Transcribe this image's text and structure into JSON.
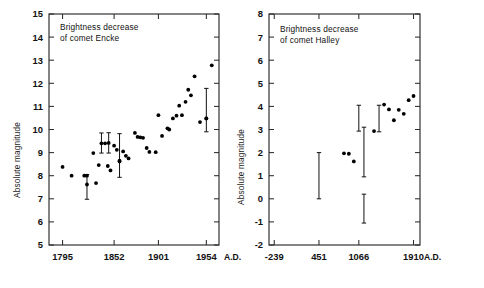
{
  "figure": {
    "background": "#ffffff",
    "ink": "#111111"
  },
  "panels": [
    {
      "id": "encke",
      "title_line1": "Brightness decrease",
      "title_line2": "of comet Encke",
      "ylabel": "Absolute magnitude",
      "xaxis_suffix": "A.D.",
      "chart_data": {
        "type": "scatter",
        "title": "Brightness decrease of comet Encke",
        "xlabel": "A.D.",
        "ylabel": "Absolute magnitude",
        "ylim": [
          5,
          15
        ],
        "xlim": [
          1780,
          1968
        ],
        "grid": false,
        "legend": null,
        "ytick_labels": [
          "5",
          "6",
          "7",
          "8",
          "9",
          "10",
          "11",
          "12",
          "13",
          "14",
          "15"
        ],
        "ytick_values": [
          5,
          6,
          7,
          8,
          9,
          10,
          11,
          12,
          13,
          14,
          15
        ],
        "xtick_labels": [
          "1795",
          "1852",
          "1901",
          "1954"
        ],
        "xtick_values": [
          1795,
          1852,
          1901,
          1954
        ],
        "points": [
          {
            "x": 1795,
            "y": 8.38
          },
          {
            "x": 1805,
            "y": 8.0
          },
          {
            "x": 1819,
            "y": 8.0
          },
          {
            "x": 1822,
            "y": 8.0
          },
          {
            "x": 1829,
            "y": 8.98
          },
          {
            "x": 1832,
            "y": 7.68
          },
          {
            "x": 1835,
            "y": 8.46
          },
          {
            "x": 1842,
            "y": 9.4
          },
          {
            "x": 1845,
            "y": 8.42
          },
          {
            "x": 1848,
            "y": 8.23
          },
          {
            "x": 1852,
            "y": 9.3
          },
          {
            "x": 1855,
            "y": 9.12
          },
          {
            "x": 1858,
            "y": 8.62
          },
          {
            "x": 1862,
            "y": 9.05
          },
          {
            "x": 1865,
            "y": 8.86
          },
          {
            "x": 1868,
            "y": 8.75
          },
          {
            "x": 1875,
            "y": 9.85
          },
          {
            "x": 1878,
            "y": 9.68
          },
          {
            "x": 1881,
            "y": 9.66
          },
          {
            "x": 1884,
            "y": 9.64
          },
          {
            "x": 1888,
            "y": 9.2
          },
          {
            "x": 1891,
            "y": 9.03
          },
          {
            "x": 1898,
            "y": 9.02
          },
          {
            "x": 1901,
            "y": 10.62
          },
          {
            "x": 1905,
            "y": 9.72
          },
          {
            "x": 1911,
            "y": 10.05
          },
          {
            "x": 1913,
            "y": 10.0
          },
          {
            "x": 1917,
            "y": 10.48
          },
          {
            "x": 1921,
            "y": 10.6
          },
          {
            "x": 1924,
            "y": 11.03
          },
          {
            "x": 1927,
            "y": 10.62
          },
          {
            "x": 1931,
            "y": 11.2
          },
          {
            "x": 1934,
            "y": 11.72
          },
          {
            "x": 1937,
            "y": 11.48
          },
          {
            "x": 1941,
            "y": 12.3
          },
          {
            "x": 1947,
            "y": 10.32
          },
          {
            "x": 1954,
            "y": 10.48
          },
          {
            "x": 1960,
            "y": 12.78
          }
        ],
        "error_bars": [
          {
            "x": 1822,
            "y": 7.62,
            "low": 6.98,
            "high": 8.05
          },
          {
            "x": 1838,
            "y": 9.4,
            "low": 8.98,
            "high": 9.85
          },
          {
            "x": 1846,
            "y": 9.42,
            "low": 8.98,
            "high": 9.86
          },
          {
            "x": 1858,
            "y": 8.65,
            "low": 7.93,
            "high": 9.82
          },
          {
            "x": 1954,
            "y": 10.48,
            "low": 9.9,
            "high": 11.78
          }
        ]
      }
    },
    {
      "id": "halley",
      "title_line1": "Brightness decrease",
      "title_line2": "of comet Halley",
      "ylabel": "Absolute magnitude",
      "xaxis_suffix": "A.D.",
      "chart_data": {
        "type": "scatter",
        "title": "Brightness decrease of comet Halley",
        "xlabel": "A.D.",
        "ylabel": "Absolute magnitude",
        "ylim": [
          -2,
          8
        ],
        "xlim": [
          -320,
          2010
        ],
        "grid": false,
        "legend": null,
        "ytick_labels": [
          "-2",
          "-1",
          "0",
          "1",
          "2",
          "3",
          "4",
          "5",
          "6",
          "7",
          "8"
        ],
        "ytick_values": [
          -2,
          -1,
          0,
          1,
          2,
          3,
          4,
          5,
          6,
          7,
          8
        ],
        "xtick_labels": [
          "-239",
          "451",
          "1066",
          "1910"
        ],
        "xtick_values": [
          -239,
          451,
          1066,
          1910
        ],
        "points": [
          {
            "x": 837,
            "y": 1.97
          },
          {
            "x": 912,
            "y": 1.95
          },
          {
            "x": 989,
            "y": 1.62
          },
          {
            "x": 1301,
            "y": 2.93
          },
          {
            "x": 1456,
            "y": 4.08
          },
          {
            "x": 1531,
            "y": 3.87
          },
          {
            "x": 1607,
            "y": 3.4
          },
          {
            "x": 1682,
            "y": 3.85
          },
          {
            "x": 1759,
            "y": 3.68
          },
          {
            "x": 1835,
            "y": 4.27
          },
          {
            "x": 1910,
            "y": 4.45
          }
        ],
        "error_bars": [
          {
            "x": 451,
            "y": 1.0,
            "low": 0.0,
            "high": 2.0
          },
          {
            "x": 1066,
            "y": 3.45,
            "low": 2.93,
            "high": 4.05
          },
          {
            "x": 1145,
            "y": 2.0,
            "low": 0.95,
            "high": 3.1
          },
          {
            "x": 1145,
            "y": -0.45,
            "low": -1.05,
            "high": 0.2
          },
          {
            "x": 1378,
            "y": 3.5,
            "low": 2.9,
            "high": 4.05
          }
        ]
      }
    }
  ]
}
